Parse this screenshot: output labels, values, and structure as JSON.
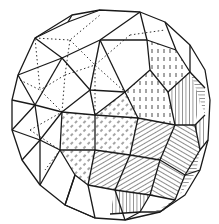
{
  "figure": {
    "caption": "",
    "colors": {
      "background": "#ffffff",
      "ink": "#1a1a1a"
    },
    "style": {
      "solid_edges": "front-facing edges",
      "dotted_edges": "hidden/back edges",
      "hatching": "shaded faces on lower-right"
    }
  }
}
